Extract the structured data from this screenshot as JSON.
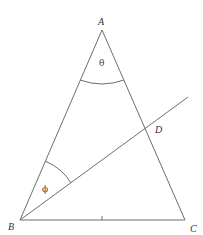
{
  "diagram": {
    "type": "triangle-geometry",
    "stroke_color": "#6e6e6e",
    "vertices": {
      "A": {
        "label": "A"
      },
      "B": {
        "label": "B"
      },
      "C": {
        "label": "C"
      },
      "D": {
        "label": "D"
      }
    },
    "angles": {
      "theta": {
        "label": "θ",
        "at": "A"
      },
      "phi": {
        "label": "ϕ",
        "at": "B"
      }
    },
    "segments": [
      "AB",
      "AC",
      "BC",
      "BD-extended"
    ],
    "tick_mark_on": "BC"
  }
}
